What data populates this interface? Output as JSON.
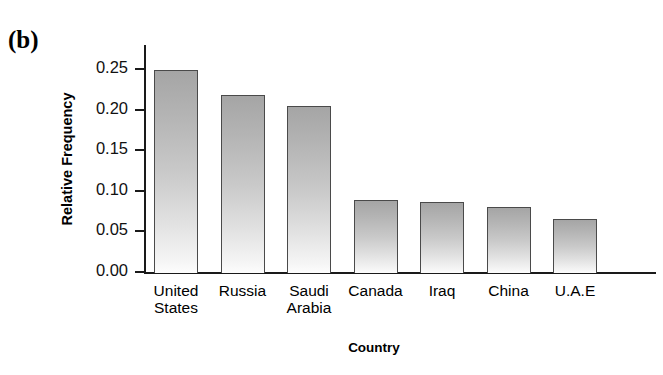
{
  "panel": {
    "label": "(b)"
  },
  "chart_data": {
    "type": "bar",
    "title": "",
    "subtitle": "",
    "xlabel": "Country",
    "ylabel": "Relative Frequency",
    "categories": [
      "United\nStates",
      "Russia",
      "Saudi\nArabia",
      "Canada",
      "Iraq",
      "China",
      "U.A.E"
    ],
    "values": [
      0.249,
      0.218,
      0.205,
      0.089,
      0.086,
      0.08,
      0.065
    ],
    "ylim": [
      0.0,
      0.28
    ],
    "ytick_values": [
      0.0,
      0.05,
      0.1,
      0.15,
      0.2,
      0.25
    ],
    "ytick_labels": [
      "0.00",
      "0.05",
      "0.10",
      "0.15",
      "0.20",
      "0.25"
    ],
    "grid": false,
    "legend": null,
    "legend_position": "none",
    "bar_fill_top_color": "#a5a5a5",
    "bar_fill_bottom_color": "#fdfdfd",
    "bar_edge_color": "#4a4a4a",
    "axis_color": "#1a1a1a",
    "background_color": "#ffffff"
  }
}
